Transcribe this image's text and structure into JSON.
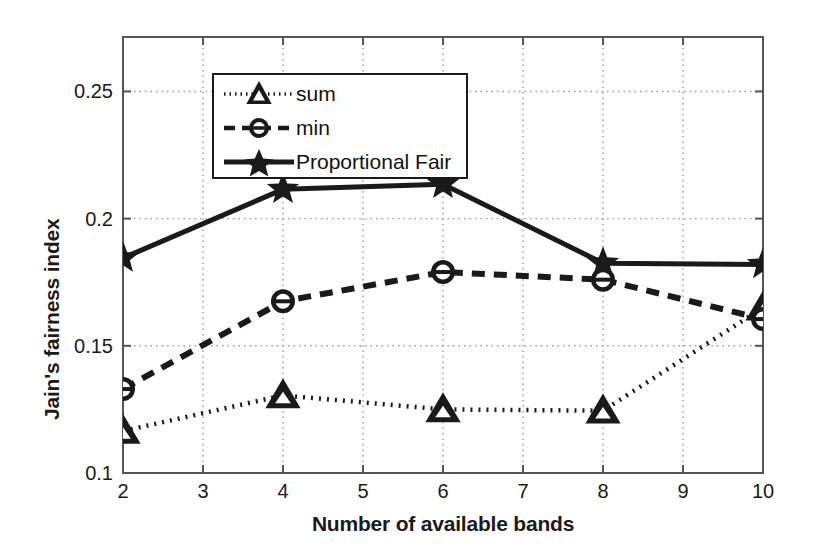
{
  "chart_data": {
    "type": "line",
    "title": "",
    "xlabel": "Number of available bands",
    "ylabel": "Jain's fairness index",
    "x": [
      2,
      4,
      6,
      8,
      10
    ],
    "xlim": [
      2,
      10
    ],
    "ylim": [
      0.1,
      0.2714
    ],
    "xticks": [
      2,
      3,
      4,
      5,
      6,
      7,
      8,
      9,
      10
    ],
    "xticklabels": [
      "2",
      "3",
      "4",
      "5",
      "6",
      "7",
      "8",
      "9",
      "10"
    ],
    "yticks": [
      0.1,
      0.15,
      0.2,
      0.25
    ],
    "yticklabels": [
      "0.1",
      "0.15",
      "0.2",
      "0.25"
    ],
    "grid": true,
    "grid_style": "dotted",
    "legend_position": "upper left",
    "series": [
      {
        "name": "sum",
        "values": [
          0.1165,
          0.1305,
          0.125,
          0.1245,
          0.165
        ],
        "linestyle": "dotted",
        "marker": "triangle",
        "color": "#1a1a1a"
      },
      {
        "name": "min",
        "values": [
          0.133,
          0.1675,
          0.179,
          0.176,
          0.1605
        ],
        "linestyle": "dashed",
        "marker": "circle",
        "color": "#1a1a1a"
      },
      {
        "name": "Proportional Fair",
        "values": [
          0.1845,
          0.2115,
          0.2135,
          0.1825,
          0.182
        ],
        "linestyle": "solid",
        "marker": "star",
        "color": "#1a1a1a"
      }
    ]
  },
  "legend": {
    "items": [
      {
        "label": "sum"
      },
      {
        "label": "min"
      },
      {
        "label": "Proportional Fair"
      }
    ]
  },
  "axes": {
    "x_title": "Number of available bands",
    "y_title": "Jain's fairness index",
    "x_tick_labels": [
      "2",
      "3",
      "4",
      "5",
      "6",
      "7",
      "8",
      "9",
      "10"
    ],
    "y_tick_labels": [
      "0.1",
      "0.15",
      "0.2",
      "0.25"
    ]
  },
  "colors": {
    "foreground": "#1a1a1a",
    "background": "#ffffff",
    "grid": "#9a9a9a"
  }
}
